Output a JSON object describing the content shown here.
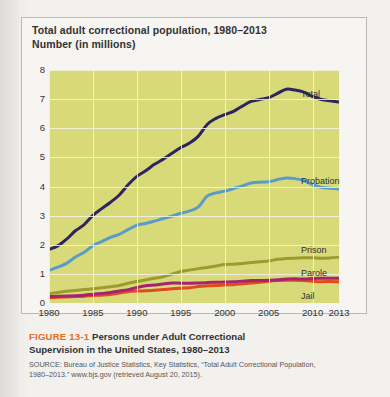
{
  "figure": {
    "chart_title_line1": "Total adult correctional population, 1980–2013",
    "chart_title_line2": "Number (in millions)",
    "figure_number": "FIGURE 13-1",
    "caption_line1": "Persons under Adult Correctional",
    "caption_line2": "Supervision in the United States, 1980–2013",
    "source_line1": "SOURCE: Bureau of Justice Statistics, Key Statistics, “Total Adult Correctional Population,",
    "source_line2": "1980–2013.” www.bjs.gov (retrieved August 20, 2015)."
  },
  "chart_data": {
    "type": "line",
    "title": "Total adult correctional population, 1980–2013",
    "subtitle": "Number (in millions)",
    "xlabel": "",
    "ylabel": "Number (in millions)",
    "xlim": [
      1980,
      2013
    ],
    "ylim": [
      0,
      8
    ],
    "ytick_labels": [
      "0",
      "1",
      "2",
      "3",
      "4",
      "5",
      "6",
      "7",
      "8"
    ],
    "ytick_values": [
      0,
      1,
      2,
      3,
      4,
      5,
      6,
      7,
      8
    ],
    "xtick_labels": [
      "1980",
      "1985",
      "1990",
      "1995",
      "2000",
      "2005",
      "2010",
      "2013"
    ],
    "xtick_values": [
      1980,
      1985,
      1990,
      1995,
      2000,
      2005,
      2010,
      2013
    ],
    "grid": true,
    "legend_position": "inline-right-of-each-line",
    "plot_background": "#d8da7a",
    "x": [
      1980,
      1981,
      1982,
      1983,
      1984,
      1985,
      1986,
      1987,
      1988,
      1989,
      1990,
      1991,
      1992,
      1993,
      1994,
      1995,
      1996,
      1997,
      1998,
      1999,
      2000,
      2001,
      2002,
      2003,
      2004,
      2005,
      2006,
      2007,
      2008,
      2009,
      2010,
      2011,
      2012,
      2013
    ],
    "series": [
      {
        "name": "Total",
        "color": "#2d2560",
        "values": [
          1.84,
          1.96,
          2.19,
          2.48,
          2.69,
          3.01,
          3.24,
          3.46,
          3.71,
          4.06,
          4.35,
          4.54,
          4.76,
          4.94,
          5.14,
          5.34,
          5.49,
          5.73,
          6.13,
          6.34,
          6.47,
          6.58,
          6.76,
          6.92,
          6.99,
          7.05,
          7.2,
          7.34,
          7.31,
          7.24,
          7.09,
          6.99,
          6.94,
          6.9
        ],
        "label": "Total"
      },
      {
        "name": "Probation",
        "color": "#5b9bc8",
        "values": [
          1.12,
          1.23,
          1.36,
          1.58,
          1.74,
          1.97,
          2.11,
          2.25,
          2.36,
          2.52,
          2.67,
          2.73,
          2.81,
          2.9,
          2.98,
          3.08,
          3.16,
          3.3,
          3.67,
          3.78,
          3.84,
          3.93,
          4.02,
          4.12,
          4.15,
          4.16,
          4.24,
          4.29,
          4.27,
          4.2,
          4.06,
          3.97,
          3.94,
          3.91
        ]
      },
      {
        "name": "Prison",
        "color": "#9b9b2e",
        "values": [
          0.32,
          0.36,
          0.4,
          0.43,
          0.46,
          0.49,
          0.52,
          0.56,
          0.6,
          0.68,
          0.74,
          0.79,
          0.85,
          0.9,
          0.99,
          1.08,
          1.13,
          1.18,
          1.22,
          1.27,
          1.32,
          1.33,
          1.36,
          1.39,
          1.42,
          1.44,
          1.5,
          1.53,
          1.54,
          1.55,
          1.55,
          1.54,
          1.55,
          1.57
        ]
      },
      {
        "name": "Parole",
        "color": "#a52472",
        "values": [
          0.22,
          0.23,
          0.24,
          0.25,
          0.27,
          0.3,
          0.33,
          0.36,
          0.41,
          0.46,
          0.53,
          0.59,
          0.62,
          0.65,
          0.69,
          0.68,
          0.68,
          0.69,
          0.7,
          0.71,
          0.72,
          0.73,
          0.75,
          0.77,
          0.77,
          0.78,
          0.8,
          0.82,
          0.83,
          0.82,
          0.84,
          0.85,
          0.85,
          0.85
        ]
      },
      {
        "name": "Jail",
        "color": "#e04a1f",
        "values": [
          0.18,
          0.2,
          0.21,
          0.22,
          0.23,
          0.26,
          0.27,
          0.29,
          0.34,
          0.39,
          0.41,
          0.42,
          0.44,
          0.46,
          0.49,
          0.51,
          0.52,
          0.57,
          0.59,
          0.6,
          0.62,
          0.63,
          0.66,
          0.69,
          0.71,
          0.75,
          0.77,
          0.78,
          0.78,
          0.77,
          0.75,
          0.73,
          0.74,
          0.73
        ]
      }
    ]
  }
}
